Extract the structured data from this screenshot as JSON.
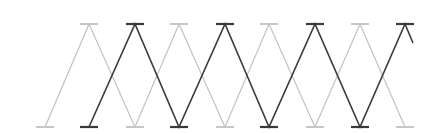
{
  "canvas": {
    "width": 440,
    "height": 134,
    "background": "#ffffff"
  },
  "geometry": {
    "top_y": 24,
    "bottom_y": 127,
    "tick_half_width": 9
  },
  "series": [
    {
      "name": "light-zigzag",
      "color": "#c4c4c4",
      "stroke_width": 1.3,
      "points": [
        [
          45,
          127
        ],
        [
          89,
          24
        ],
        [
          135,
          127
        ],
        [
          179,
          24
        ],
        [
          225,
          127
        ],
        [
          269,
          24
        ],
        [
          315,
          127
        ],
        [
          360,
          24
        ],
        [
          405,
          127
        ]
      ],
      "ticks": [
        [
          45,
          127
        ],
        [
          89,
          24
        ],
        [
          135,
          127
        ],
        [
          179,
          24
        ],
        [
          225,
          127
        ],
        [
          269,
          24
        ],
        [
          315,
          127
        ],
        [
          360,
          24
        ],
        [
          405,
          127
        ]
      ]
    },
    {
      "name": "dark-zigzag",
      "color": "#3a3a3a",
      "stroke_width": 1.6,
      "points": [
        [
          89,
          127
        ],
        [
          135,
          24
        ],
        [
          179,
          127
        ],
        [
          225,
          24
        ],
        [
          269,
          127
        ],
        [
          315,
          24
        ],
        [
          360,
          127
        ],
        [
          405,
          24
        ],
        [
          413,
          43
        ]
      ],
      "ticks": [
        [
          89,
          127
        ],
        [
          135,
          24
        ],
        [
          179,
          127
        ],
        [
          225,
          24
        ],
        [
          269,
          127
        ],
        [
          315,
          24
        ],
        [
          360,
          127
        ],
        [
          405,
          24
        ]
      ]
    }
  ]
}
